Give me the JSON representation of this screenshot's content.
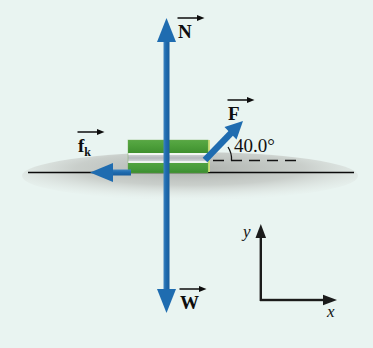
{
  "figure": {
    "type": "free-body-diagram",
    "background_color": "#e9f4f1",
    "title": "",
    "surface": {
      "name": "ground-line",
      "color": "#000000",
      "shadow_color": "#b9bcb8"
    },
    "block": {
      "label": "",
      "top_band_color": "#4aa03c",
      "middle_band_color": "#b9bcc0",
      "bottom_band_color": "#4aa03c",
      "edge_color": "#8fbf5a"
    },
    "vectors": [
      {
        "id": "normal",
        "symbol": "N",
        "subscript": "",
        "direction": "up",
        "color": "#1f6cb0"
      },
      {
        "id": "weight",
        "symbol": "W",
        "subscript": "",
        "direction": "down",
        "color": "#1f6cb0"
      },
      {
        "id": "applied-force",
        "symbol": "F",
        "subscript": "",
        "direction": "up-right",
        "color": "#1f6cb0"
      },
      {
        "id": "kinetic-friction",
        "symbol": "f",
        "subscript": "k",
        "direction": "left",
        "color": "#1f6cb0"
      }
    ],
    "angle": {
      "name": "force-angle",
      "value": "40.0°",
      "measured_from": "horizontal",
      "reference_line_style": "dashed"
    },
    "axes": {
      "x_label": "x",
      "y_label": "y",
      "color": "#111111"
    }
  }
}
